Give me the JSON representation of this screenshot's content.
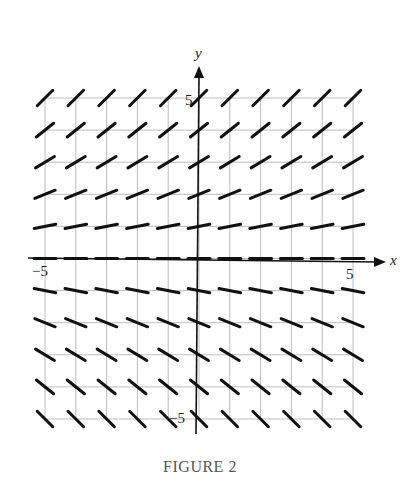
{
  "chart_data": {
    "type": "slope_field",
    "title": "FIGURE 2",
    "xlabel": "x",
    "ylabel": "y",
    "xlim": [
      -5,
      5
    ],
    "ylim": [
      -5,
      5
    ],
    "grid": true,
    "grid_step": 1,
    "tick_labels": {
      "x": [
        "-5",
        "5"
      ],
      "y": [
        "5",
        "-5"
      ]
    },
    "x": [
      -5,
      -4,
      -3,
      -2,
      -1,
      0,
      1,
      2,
      3,
      4,
      5
    ],
    "y": [
      5,
      4,
      3,
      2,
      1,
      0,
      -1,
      -2,
      -3,
      -4,
      -5
    ],
    "slope_by_y": {
      "5": 1.0,
      "4": 0.8,
      "3": 0.6,
      "2": 0.4,
      "1": 0.2,
      "0": 0,
      "-1": -0.2,
      "-2": -0.4,
      "-3": -0.6,
      "-4": -0.8,
      "-5": -1.0
    }
  },
  "labels": {
    "x_axis": "x",
    "y_axis": "y",
    "x_min": "−5",
    "x_max": "5",
    "y_max": "5",
    "y_min": "−5",
    "caption": "FIGURE 2"
  },
  "colors": {
    "grid": "#bdbdbd",
    "axis": "#111111",
    "segment": "#111111"
  }
}
